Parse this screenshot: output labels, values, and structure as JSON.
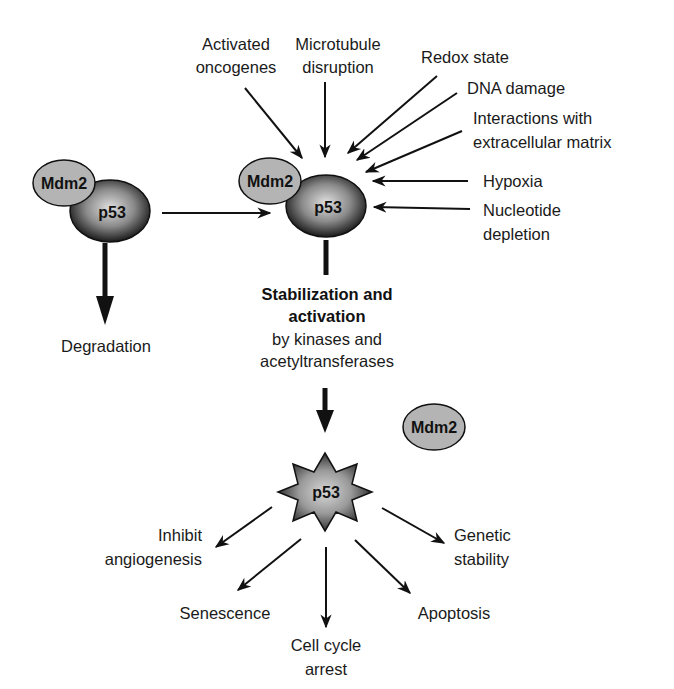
{
  "diagram": {
    "nodes": {
      "left_complex": {
        "mdm2": "Mdm2",
        "p53": "p53"
      },
      "center_complex": {
        "mdm2": "Mdm2",
        "p53": "p53"
      },
      "free_mdm2": "Mdm2",
      "active_p53": "p53"
    },
    "stimuli": [
      {
        "lines": [
          "Activated",
          "oncogenes"
        ]
      },
      {
        "lines": [
          "Microtubule",
          "disruption"
        ]
      },
      {
        "lines": [
          "Redox state"
        ]
      },
      {
        "lines": [
          "DNA damage"
        ]
      },
      {
        "lines": [
          "Interactions with",
          "extracellular matrix"
        ]
      },
      {
        "lines": [
          "Hypoxia"
        ]
      },
      {
        "lines": [
          "Nucleotide",
          "depletion"
        ]
      }
    ],
    "degradation": "Degradation",
    "stabilization": {
      "bold_line1": "Stabilization and",
      "bold_line2": "activation",
      "line3": "by kinases and",
      "line4": "acetyltransferases"
    },
    "outcomes": [
      {
        "lines": [
          "Inhibit",
          "angiogenesis"
        ]
      },
      {
        "lines": [
          "Senescence"
        ]
      },
      {
        "lines": [
          "Cell cycle",
          "arrest"
        ]
      },
      {
        "lines": [
          "Apoptosis"
        ]
      },
      {
        "lines": [
          "Genetic",
          "stability"
        ]
      }
    ],
    "colors": {
      "mdm2_fill": "#b4b4b4",
      "p53_center": "#d8d8d8",
      "p53_edge": "#1a1a1a",
      "stroke": "#111111"
    }
  }
}
